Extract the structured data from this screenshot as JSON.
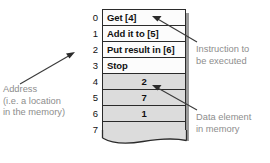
{
  "diagram": {
    "colors": {
      "instruction_cell": "#fcfcfc",
      "data_cell": "#dcdcdc",
      "border": "#2b2b2b",
      "annotation_text": "#8d8d8d",
      "cell_text": "#111111",
      "shadow": "#9a9a9a"
    }
  },
  "memory": {
    "rows": [
      {
        "address": "0",
        "content": "Get [4]",
        "kind": "instruction"
      },
      {
        "address": "1",
        "content": "Add it to [5]",
        "kind": "instruction"
      },
      {
        "address": "2",
        "content": "Put result in [6]",
        "kind": "instruction"
      },
      {
        "address": "3",
        "content": "Stop",
        "kind": "instruction"
      },
      {
        "address": "4",
        "content": "2",
        "kind": "data"
      },
      {
        "address": "5",
        "content": "7",
        "kind": "data"
      },
      {
        "address": "6",
        "content": "1",
        "kind": "data"
      },
      {
        "address": "7",
        "content": "",
        "kind": "empty"
      }
    ]
  },
  "annotations": {
    "address": "Address\n(i.e. a location\nin the memory)",
    "instruction": "Instruction to\nbe executed",
    "data": "Data element\nin memory"
  }
}
